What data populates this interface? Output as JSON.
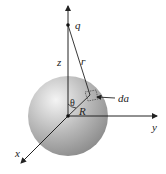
{
  "diagram": {
    "type": "sphere-point-charge-geometry",
    "labels": {
      "charge": "q",
      "z_axis": "z",
      "separation": "ᴦ",
      "angle": "θ",
      "radius": "R",
      "area_element": "da",
      "y_axis": "y",
      "x_axis": "x"
    },
    "colors": {
      "sphere_light": "#f2f2f2",
      "sphere_mid": "#b8b8b8",
      "sphere_dark": "#8a8a8a",
      "lines": "#222222"
    }
  }
}
